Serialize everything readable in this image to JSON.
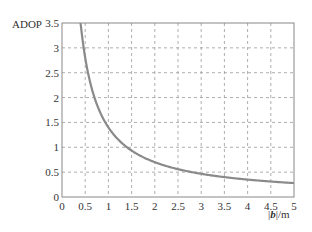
{
  "chart_data": {
    "type": "line",
    "title": "",
    "xlabel": "|b|/m",
    "ylabel": "ADOP",
    "xlim": [
      0,
      5
    ],
    "ylim": [
      0,
      3.5
    ],
    "grid": true,
    "legend": null,
    "x_ticks": [
      "0",
      "0.5",
      "1",
      "1.5",
      "2",
      "2.5",
      "3",
      "3.5",
      "4",
      "4.5",
      "5"
    ],
    "y_ticks": [
      "0",
      "0.5",
      "1",
      "1.5",
      "2",
      "2.5",
      "3",
      "3.5"
    ],
    "series": [
      {
        "name": "ADOP",
        "color": "#8a8a8a",
        "x": [
          0.4,
          0.5,
          0.6,
          0.75,
          1.0,
          1.25,
          1.5,
          2.0,
          2.5,
          3.0,
          3.5,
          4.0,
          4.5,
          5.0
        ],
        "y": [
          3.5,
          2.8,
          2.33,
          1.87,
          1.4,
          1.12,
          0.93,
          0.7,
          0.56,
          0.47,
          0.4,
          0.35,
          0.31,
          0.28
        ]
      }
    ]
  },
  "axes": {
    "ylabel": "ADOP",
    "xlabel_prefix": "|",
    "xlabel_var": "b",
    "xlabel_suffix": "|/m"
  }
}
